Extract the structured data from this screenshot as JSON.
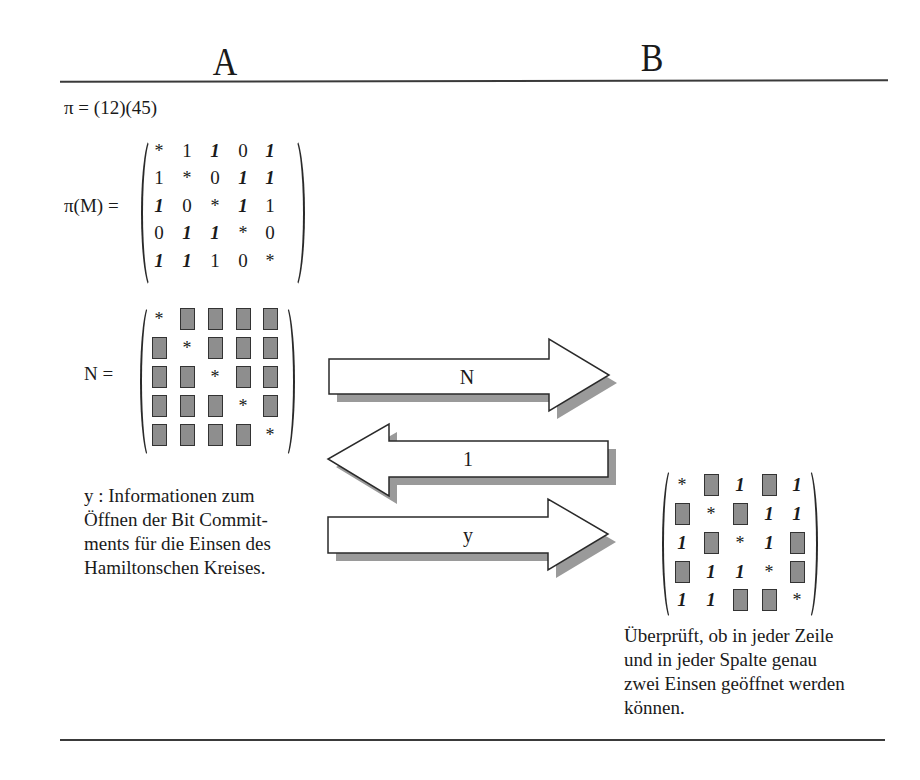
{
  "header": {
    "party_a": "A",
    "party_b": "B"
  },
  "left": {
    "permutation": "π = (12)(45)",
    "pi_m_label": "π(M) =",
    "pi_m_matrix": [
      [
        {
          "v": "*",
          "t": "star"
        },
        {
          "v": "1",
          "t": "plain"
        },
        {
          "v": "1",
          "t": "one"
        },
        {
          "v": "0",
          "t": "plain"
        },
        {
          "v": "1",
          "t": "one"
        }
      ],
      [
        {
          "v": "1",
          "t": "plain"
        },
        {
          "v": "*",
          "t": "star"
        },
        {
          "v": "0",
          "t": "plain"
        },
        {
          "v": "1",
          "t": "one"
        },
        {
          "v": "1",
          "t": "one"
        }
      ],
      [
        {
          "v": "1",
          "t": "one"
        },
        {
          "v": "0",
          "t": "plain"
        },
        {
          "v": "*",
          "t": "star"
        },
        {
          "v": "1",
          "t": "one"
        },
        {
          "v": "1",
          "t": "plain"
        }
      ],
      [
        {
          "v": "0",
          "t": "plain"
        },
        {
          "v": "1",
          "t": "one"
        },
        {
          "v": "1",
          "t": "one"
        },
        {
          "v": "*",
          "t": "star"
        },
        {
          "v": "0",
          "t": "plain"
        }
      ],
      [
        {
          "v": "1",
          "t": "one"
        },
        {
          "v": "1",
          "t": "one"
        },
        {
          "v": "1",
          "t": "plain"
        },
        {
          "v": "0",
          "t": "plain"
        },
        {
          "v": "*",
          "t": "star"
        }
      ]
    ],
    "n_label": "N =",
    "n_matrix": [
      [
        "*",
        "box",
        "box",
        "box",
        "box"
      ],
      [
        "box",
        "*",
        "box",
        "box",
        "box"
      ],
      [
        "box",
        "box",
        "*",
        "box",
        "box"
      ],
      [
        "box",
        "box",
        "box",
        "*",
        "box"
      ],
      [
        "box",
        "box",
        "box",
        "box",
        "*"
      ]
    ],
    "y_description": [
      "y : Informationen zum",
      "Öffnen der Bit Commit-",
      "ments für die Einsen des",
      "Hamiltonschen Kreises."
    ]
  },
  "messages": [
    {
      "label": "N",
      "direction": "A→B"
    },
    {
      "label": "1",
      "direction": "B→A"
    },
    {
      "label": "y",
      "direction": "A→B"
    }
  ],
  "right": {
    "opened_matrix": [
      [
        "*",
        "box",
        "1",
        "box",
        "1"
      ],
      [
        "box",
        "*",
        "box",
        "1",
        "1"
      ],
      [
        "1",
        "box",
        "*",
        "1",
        "box"
      ],
      [
        "box",
        "1",
        "1",
        "*",
        "box"
      ],
      [
        "1",
        "1",
        "box",
        "box",
        "*"
      ]
    ],
    "check_description": [
      "Überprüft, ob in jeder Zeile",
      "und in jeder Spalte genau",
      "zwei Einsen geöffnet werden",
      "können."
    ]
  },
  "colors": {
    "box_fill": "#8e8e8e",
    "shadow": "#9a9a9a",
    "line": "#3a3a3a"
  }
}
